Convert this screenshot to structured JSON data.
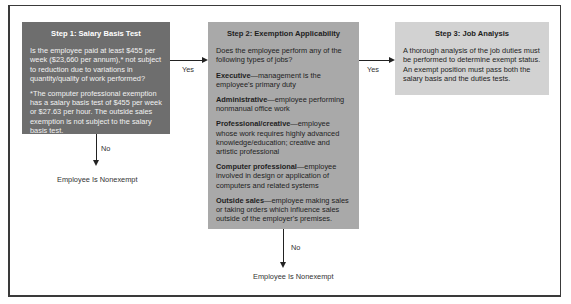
{
  "steps": [
    {
      "title": "Step 1: Salary Basis Test",
      "question": "Is the employee paid at least $455 per week ($23,660 per annum),* not subject to reduction due to variations in quantity/quality of work performed?",
      "footnote": "*The computer professional exemption has a salary basis test of $455 per week or $27.63 per hour. The outside sales exemption is not subject to the salary basis test.",
      "fill_color": "#6e6e6e"
    },
    {
      "title": "Step 2: Exemption Applicability",
      "question": "Does the employee perform any of the following types of jobs?",
      "categories": [
        {
          "name": "Executive",
          "desc": "—management is the employee's primary duty"
        },
        {
          "name": "Administrative",
          "desc": "—employee performing nonmanual office work"
        },
        {
          "name": "Professional/creative",
          "desc": "—employee whose work requires highly advanced knowledge/education; creative and artistic professional"
        },
        {
          "name": "Computer professional",
          "desc": "—employee involved in design or application of computers and related systems"
        },
        {
          "name": "Outside sales",
          "desc": "—employee making sales or taking orders which influence sales outside of the employer's premises."
        }
      ],
      "fill_color": "#a9a9a9"
    },
    {
      "title": "Step 3: Job Analysis",
      "text": "A thorough analysis of the job duties must be performed to determine exempt status. An exempt position must pass both the salary basis and the duties tests.",
      "fill_color": "#d2d2d2"
    }
  ],
  "connectors": {
    "yes_1_2": "Yes",
    "yes_2_3": "Yes",
    "no_1": "No",
    "no_2": "No"
  },
  "outcomes": {
    "step1_no": "Employee Is Nonexempt",
    "step2_no": "Employee Is Nonexempt"
  }
}
